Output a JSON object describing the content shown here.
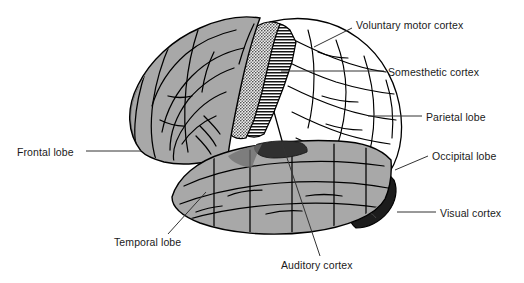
{
  "figure": {
    "background_color": "#ffffff",
    "width": 524,
    "height": 283
  },
  "colors": {
    "outline": "#000000",
    "cortex_grey": "#a8a8a8",
    "cortex_grey_dark": "#8f8f8f",
    "cortex_white": "#ffffff",
    "motor_stipple": "#3c3c3c",
    "somesthetic_hatch": "#111111",
    "auditory_dark": "#303030",
    "visual_dark": "#1c1c1c",
    "leader_line": "#333333",
    "text": "#1a1a1a"
  },
  "labels": [
    {
      "id": "voluntary-motor-cortex",
      "text": "Voluntary motor cortex",
      "side": "right",
      "x": 356,
      "y": 19,
      "leader": {
        "x1": 352,
        "y1": 28,
        "x2": 314,
        "y2": 47
      }
    },
    {
      "id": "somesthetic-cortex",
      "text": "Somesthetic cortex",
      "side": "right",
      "x": 388,
      "y": 66,
      "leader": {
        "x1": 384,
        "y1": 71,
        "x2": 281,
        "y2": 71
      }
    },
    {
      "id": "parietal-lobe",
      "text": "Parietal lobe",
      "side": "right",
      "x": 426,
      "y": 111,
      "leader": {
        "x1": 422,
        "y1": 116,
        "x2": 368,
        "y2": 116
      }
    },
    {
      "id": "occipital-lobe",
      "text": "Occipital lobe",
      "side": "right",
      "x": 432,
      "y": 150,
      "leader": {
        "x1": 428,
        "y1": 156,
        "x2": 395,
        "y2": 170
      }
    },
    {
      "id": "visual-cortex",
      "text": "Visual cortex",
      "side": "right",
      "x": 440,
      "y": 207,
      "leader": {
        "x1": 436,
        "y1": 212,
        "x2": 397,
        "y2": 212
      }
    },
    {
      "id": "frontal-lobe",
      "text": "Frontal lobe",
      "side": "left",
      "x": 17,
      "y": 146,
      "leader": {
        "x1": 86,
        "y1": 151,
        "x2": 141,
        "y2": 151
      }
    },
    {
      "id": "temporal-lobe",
      "text": "Temporal lobe",
      "side": "left",
      "x": 114,
      "y": 236,
      "leader": {
        "x1": 168,
        "y1": 234,
        "x2": 206,
        "y2": 192
      }
    },
    {
      "id": "auditory-cortex",
      "text": "Auditory cortex",
      "side": "left",
      "x": 281,
      "y": 259,
      "leader": {
        "x1": 320,
        "y1": 256,
        "x2": 282,
        "y2": 143
      }
    }
  ],
  "regions": [
    {
      "id": "frontal-lobe-region",
      "label": "Frontal lobe",
      "fill": "#a8a8a8"
    },
    {
      "id": "voluntary-motor-region",
      "label": "Voluntary motor cortex",
      "fill": "#3c3c3c"
    },
    {
      "id": "somesthetic-region",
      "label": "Somesthetic cortex",
      "fill": "#111111"
    },
    {
      "id": "parietal-lobe-region",
      "label": "Parietal lobe",
      "fill": "#ffffff"
    },
    {
      "id": "occipital-lobe-region",
      "label": "Occipital lobe",
      "fill": "#ffffff"
    },
    {
      "id": "visual-cortex-region",
      "label": "Visual cortex",
      "fill": "#1c1c1c"
    },
    {
      "id": "temporal-lobe-region",
      "label": "Temporal lobe",
      "fill": "#a8a8a8"
    },
    {
      "id": "auditory-cortex-region",
      "label": "Auditory cortex",
      "fill": "#303030"
    }
  ]
}
